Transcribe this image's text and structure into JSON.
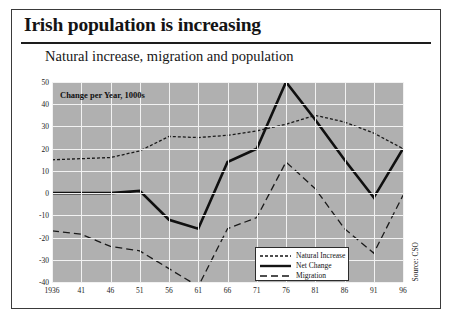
{
  "slide": {
    "title": "Irish population is increasing",
    "subtitle": "Natural increase, migration and population",
    "source": "Source: CSO"
  },
  "chart_data": {
    "type": "line",
    "title": "Natural increase, migration and population",
    "axis_note": "Change per Year, 1000s",
    "xlabel": "",
    "ylabel": "Change per Year, 1000s",
    "ylim": [
      -40,
      50
    ],
    "yticks": [
      50,
      40,
      30,
      20,
      10,
      0,
      -10,
      -20,
      -30,
      -40
    ],
    "ytick_labels": [
      "50",
      "40",
      "30",
      "20",
      "10",
      "0",
      "-10",
      "-20",
      "-30",
      "-40"
    ],
    "x": [
      1936,
      1941,
      1946,
      1951,
      1956,
      1961,
      1966,
      1971,
      1976,
      1981,
      1986,
      1991,
      1996
    ],
    "categories": [
      "1936",
      "41",
      "46",
      "51",
      "56",
      "61",
      "66",
      "71",
      "76",
      "81",
      "86",
      "91",
      "96"
    ],
    "grid": true,
    "legend_position": "bottom-right",
    "series": [
      {
        "name": "Natural Increase",
        "style": "dotted",
        "color": "#1a1a1a",
        "values": [
          15,
          15.5,
          16,
          19,
          25.5,
          25,
          26,
          28,
          31,
          35,
          32,
          27,
          20
        ]
      },
      {
        "name": "Net Change",
        "style": "solid",
        "color": "#101010",
        "values": [
          0,
          0,
          0,
          1,
          -12,
          -16,
          14,
          20,
          50,
          33,
          15,
          -2,
          20
        ]
      },
      {
        "name": "Migration",
        "style": "dashed",
        "color": "#1a1a1a",
        "values": [
          -17,
          -18.5,
          -24,
          -26,
          -34,
          -42,
          -16,
          -11,
          14,
          2,
          -16,
          -27,
          -1
        ]
      }
    ]
  },
  "legend": {
    "items": [
      {
        "label": "Natural Increase",
        "style": "dotted"
      },
      {
        "label": "Net Change",
        "style": "solid"
      },
      {
        "label": "Migration",
        "style": "dashed"
      }
    ]
  }
}
